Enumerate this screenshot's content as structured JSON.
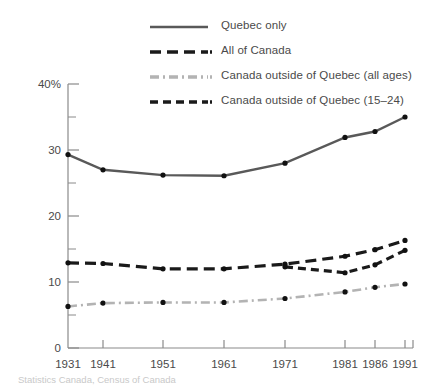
{
  "chart_data": {
    "type": "line",
    "title": "",
    "subtitle": "",
    "xlabel": "",
    "ylabel": "",
    "x": [
      "1931",
      "1941",
      "1951",
      "1961",
      "1971",
      "1981",
      "1986",
      "1991"
    ],
    "xlim": [
      1931,
      1991
    ],
    "ylim": [
      0,
      40
    ],
    "y_ticks_major": [
      "0",
      "10",
      "20",
      "30",
      "40%"
    ],
    "y_ticks_major_values": [
      0,
      10,
      20,
      30,
      40
    ],
    "y_ticks_minor_values": [
      5,
      15,
      25,
      35
    ],
    "grid": false,
    "legend_position": "top-right",
    "series": [
      {
        "name": "Quebec only",
        "style": "solid",
        "color": "#595959",
        "markers": true,
        "x": [
          "1931",
          "1941",
          "1951",
          "1961",
          "1971",
          "1981",
          "1986",
          "1991"
        ],
        "values": [
          29.3,
          27.0,
          26.2,
          26.1,
          28.0,
          31.9,
          32.8,
          35.0
        ]
      },
      {
        "name": "All of Canada",
        "style": "long-dash",
        "color": "#1a1a1a",
        "markers": true,
        "x": [
          "1931",
          "1941",
          "1951",
          "1961",
          "1971",
          "1981",
          "1986",
          "1991"
        ],
        "values": [
          12.9,
          12.8,
          12.0,
          12.0,
          12.7,
          13.9,
          14.9,
          16.3
        ]
      },
      {
        "name": "Canada outside of Quebec (all ages)",
        "style": "dash-dot",
        "color": "#b3b3b3",
        "markers": true,
        "x": [
          "1931",
          "1941",
          "1951",
          "1961",
          "1971",
          "1981",
          "1986",
          "1991"
        ],
        "values": [
          6.3,
          6.8,
          6.9,
          6.9,
          7.5,
          8.5,
          9.2,
          9.7
        ]
      },
      {
        "name": "Canada outside of Quebec (15–24)",
        "style": "short-dash",
        "color": "#1a1a1a",
        "markers": true,
        "x": [
          "1971",
          "1981",
          "1986",
          "1991"
        ],
        "values": [
          12.3,
          11.4,
          12.6,
          14.8
        ]
      }
    ]
  },
  "legend": {
    "items": [
      {
        "label": "Quebec only",
        "style": "solid",
        "color": "#595959"
      },
      {
        "label": "All of Canada",
        "style": "long-dash",
        "color": "#1a1a1a"
      },
      {
        "label": "Canada outside of Quebec (all ages)",
        "style": "dash-dot",
        "color": "#b3b3b3"
      },
      {
        "label": "Canada outside of Quebec (15–24)",
        "style": "short-dash",
        "color": "#1a1a1a"
      }
    ]
  },
  "source": {
    "note": "Statistics Canada, Census of Canada"
  }
}
